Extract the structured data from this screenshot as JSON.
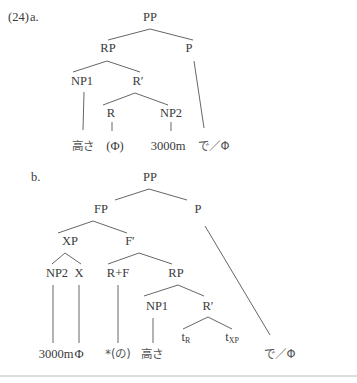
{
  "example_number": "(24)",
  "tree_a": {
    "label": "a.",
    "nodes": {
      "PP": "PP",
      "RP": "RP",
      "P": "P",
      "NP1": "NP1",
      "Rbar": "R′",
      "R": "R",
      "NP2": "NP2"
    },
    "leaves": {
      "takasa": "高さ",
      "phi_paren": "(Φ)",
      "height": "3000m",
      "de_phi": "で／Φ"
    }
  },
  "tree_b": {
    "label": "b.",
    "nodes": {
      "PP": "PP",
      "FP": "FP",
      "P": "P",
      "XP": "XP",
      "Fbar": "F′",
      "NP2": "NP2",
      "X": "X",
      "RF": "R+F",
      "RP": "RP",
      "NP1": "NP1",
      "Rbar": "R′",
      "tR_base": "t",
      "tR_sub": "R",
      "tXP_base": "t",
      "tXP_sub": "XP"
    },
    "leaves": {
      "height": "3000m",
      "phi": "Φ",
      "no": "*(の)",
      "takasa": "高さ",
      "de_phi": "で／Φ"
    }
  }
}
